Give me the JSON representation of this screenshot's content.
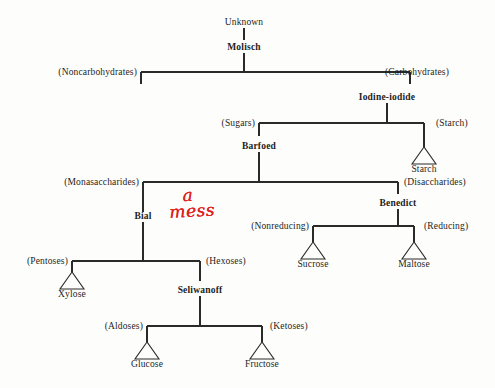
{
  "page": {
    "background_color": "#fdfdfc",
    "line_color": "#2a2a28"
  },
  "annotation": {
    "text": "a mess",
    "line1": "a",
    "line2": "mess",
    "color": "#e02020",
    "style": "handwritten-red-ink"
  },
  "tree": {
    "root": {
      "label": "Unknown"
    },
    "reagents": [
      {
        "id": "molisch",
        "label": "Molisch"
      },
      {
        "id": "iodine-iodide",
        "label": "Iodine-iodide"
      },
      {
        "id": "barfoed",
        "label": "Barfoed"
      },
      {
        "id": "bial",
        "label": "Bial"
      },
      {
        "id": "benedict",
        "label": "Benedict"
      },
      {
        "id": "seliwanoff",
        "label": "Seliwanoff"
      }
    ],
    "classes": [
      {
        "id": "noncarbohydrates",
        "label": "(Noncarbohydrates)"
      },
      {
        "id": "carbohydrates",
        "label": "(Carbohydrates)"
      },
      {
        "id": "sugars",
        "label": "(Sugars)"
      },
      {
        "id": "starch-class",
        "label": "(Starch)"
      },
      {
        "id": "monosaccharides",
        "label": "(Monasaccharides)"
      },
      {
        "id": "disaccharides",
        "label": "(Disaccharides)"
      },
      {
        "id": "nonreducing",
        "label": "(Nonreducing)"
      },
      {
        "id": "reducing",
        "label": "(Reducing)"
      },
      {
        "id": "pentoses",
        "label": "(Pentoses)"
      },
      {
        "id": "hexoses",
        "label": "(Hexoses)"
      },
      {
        "id": "aldoses",
        "label": "(Aldoses)"
      },
      {
        "id": "ketoses",
        "label": "(Ketoses)"
      }
    ],
    "terminals": [
      {
        "id": "starch",
        "label": "Starch"
      },
      {
        "id": "sucrose",
        "label": "Sucrose"
      },
      {
        "id": "maltose",
        "label": "Maltose"
      },
      {
        "id": "xylose",
        "label": "Xylose"
      },
      {
        "id": "glucose",
        "label": "Glucose"
      },
      {
        "id": "fructose",
        "label": "Fructose"
      }
    ]
  }
}
